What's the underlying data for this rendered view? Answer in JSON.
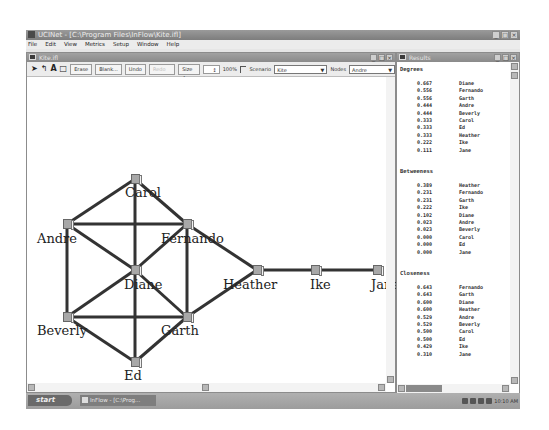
{
  "app": {
    "title": "UCINet - [C:\\Program Files\\InFlow\\Kite.ifl]",
    "menu": [
      "File",
      "Edit",
      "View",
      "Metrics",
      "Setup",
      "Window",
      "Help"
    ]
  },
  "network_window": {
    "title": "Kite.ifl",
    "toolbar": {
      "tools": [
        "select-arrow",
        "link-tool",
        "text-tool",
        "box-tool"
      ],
      "buttons": [
        "Erase",
        "Blank...",
        "Undo",
        "Redo"
      ],
      "size_label": "Size",
      "size_value": "4",
      "zoom_value": "100%",
      "scenario_label": "Scenario",
      "scenario_value": "Kite",
      "nodes_label": "Nodes",
      "nodes_value": "Andre"
    },
    "nodes": [
      {
        "id": "carol",
        "label": "Carol",
        "x": 104,
        "y": 97,
        "lx": 98,
        "ly": 108
      },
      {
        "id": "andre",
        "label": "Andre",
        "x": 36,
        "y": 142,
        "lx": 10,
        "ly": 154
      },
      {
        "id": "fernando",
        "label": "Fernando",
        "x": 156,
        "y": 142,
        "lx": 134,
        "ly": 154
      },
      {
        "id": "diane",
        "label": "Diane",
        "x": 104,
        "y": 188,
        "lx": 97,
        "ly": 200
      },
      {
        "id": "heather",
        "label": "Heather",
        "x": 226,
        "y": 188,
        "lx": 196,
        "ly": 200
      },
      {
        "id": "ike",
        "label": "Ike",
        "x": 284,
        "y": 188,
        "lx": 283,
        "ly": 200
      },
      {
        "id": "jane",
        "label": "Jane",
        "x": 346,
        "y": 188,
        "lx": 344,
        "ly": 200
      },
      {
        "id": "beverly",
        "label": "Beverly",
        "x": 36,
        "y": 235,
        "lx": 10,
        "ly": 246
      },
      {
        "id": "garth",
        "label": "Garth",
        "x": 156,
        "y": 235,
        "lx": 134,
        "ly": 246
      },
      {
        "id": "ed",
        "label": "Ed",
        "x": 104,
        "y": 280,
        "lx": 97,
        "ly": 291
      }
    ],
    "edges": [
      [
        "carol",
        "andre"
      ],
      [
        "carol",
        "fernando"
      ],
      [
        "carol",
        "diane"
      ],
      [
        "andre",
        "fernando"
      ],
      [
        "andre",
        "diane"
      ],
      [
        "andre",
        "beverly"
      ],
      [
        "fernando",
        "diane"
      ],
      [
        "fernando",
        "garth"
      ],
      [
        "fernando",
        "heather"
      ],
      [
        "diane",
        "beverly"
      ],
      [
        "diane",
        "garth"
      ],
      [
        "diane",
        "ed"
      ],
      [
        "beverly",
        "garth"
      ],
      [
        "beverly",
        "ed"
      ],
      [
        "garth",
        "ed"
      ],
      [
        "garth",
        "heather"
      ],
      [
        "heather",
        "ike"
      ],
      [
        "ike",
        "jane"
      ]
    ]
  },
  "results_window": {
    "title": "Results",
    "sections": [
      {
        "title": "Degrees",
        "rows": [
          {
            "value": "0.667",
            "name": "Diane"
          },
          {
            "value": "0.556",
            "name": "Fernando"
          },
          {
            "value": "0.556",
            "name": "Garth"
          },
          {
            "value": "0.444",
            "name": "Andre"
          },
          {
            "value": "0.444",
            "name": "Beverly"
          },
          {
            "value": "0.333",
            "name": "Carol"
          },
          {
            "value": "0.333",
            "name": "Ed"
          },
          {
            "value": "0.333",
            "name": "Heather"
          },
          {
            "value": "0.222",
            "name": "Ike"
          },
          {
            "value": "0.111",
            "name": "Jane"
          }
        ]
      },
      {
        "title": "Betweeness",
        "rows": [
          {
            "value": "0.389",
            "name": "Heather"
          },
          {
            "value": "0.231",
            "name": "Fernando"
          },
          {
            "value": "0.231",
            "name": "Garth"
          },
          {
            "value": "0.222",
            "name": "Ike"
          },
          {
            "value": "0.102",
            "name": "Diane"
          },
          {
            "value": "0.023",
            "name": "Andre"
          },
          {
            "value": "0.023",
            "name": "Beverly"
          },
          {
            "value": "0.000",
            "name": "Carol"
          },
          {
            "value": "0.000",
            "name": "Ed"
          },
          {
            "value": "0.000",
            "name": "Jane"
          }
        ]
      },
      {
        "title": "Closeness",
        "rows": [
          {
            "value": "0.643",
            "name": "Fernando"
          },
          {
            "value": "0.643",
            "name": "Garth"
          },
          {
            "value": "0.600",
            "name": "Diane"
          },
          {
            "value": "0.600",
            "name": "Heather"
          },
          {
            "value": "0.529",
            "name": "Andre"
          },
          {
            "value": "0.529",
            "name": "Beverly"
          },
          {
            "value": "0.500",
            "name": "Carol"
          },
          {
            "value": "0.500",
            "name": "Ed"
          },
          {
            "value": "0.429",
            "name": "Ike"
          },
          {
            "value": "0.310",
            "name": "Jane"
          }
        ]
      }
    ]
  },
  "taskbar": {
    "start_label": "start",
    "task_label": "InFlow - [C:\\Prog...",
    "clock": "10:10 AM"
  }
}
